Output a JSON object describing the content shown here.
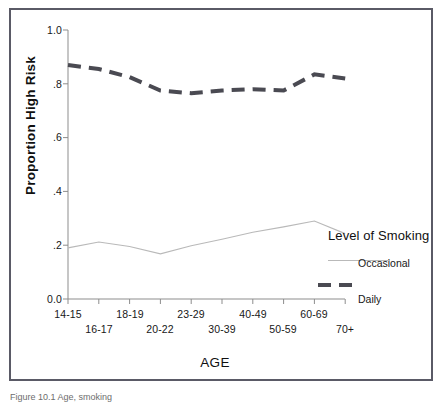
{
  "chart_data": {
    "type": "line",
    "title": "",
    "xlabel": "AGE",
    "ylabel": "Proportion High Risk",
    "ylim": [
      0.0,
      1.0
    ],
    "ytick_labels": [
      "1.0",
      ".8",
      ".6",
      ".4",
      ".2",
      "0.0"
    ],
    "ytick_values": [
      1.0,
      0.8,
      0.6,
      0.4,
      0.2,
      0.0
    ],
    "grid": false,
    "legend_position": "right",
    "categories": [
      "14-15",
      "16-17",
      "18-19",
      "20-22",
      "23-29",
      "30-39",
      "40-49",
      "50-59",
      "60-69",
      "70+"
    ],
    "series": [
      {
        "name": "Daily",
        "style": "thick-dashed",
        "color": "#4a4a52",
        "values": [
          0.87,
          0.855,
          0.825,
          0.775,
          0.765,
          0.775,
          0.78,
          0.775,
          0.835,
          0.82
        ]
      },
      {
        "name": "Occasional",
        "style": "thin-solid",
        "color": "#b9b9b9",
        "values": [
          0.19,
          0.212,
          0.195,
          0.168,
          0.198,
          0.222,
          0.248,
          0.268,
          0.29,
          0.243
        ]
      }
    ]
  },
  "legend": {
    "title": "Level of Smoking",
    "entries": [
      {
        "label": "Occasional",
        "swatch": "thin-line-swatch"
      },
      {
        "label": "Daily",
        "swatch": "thick-dashed-swatch"
      }
    ]
  },
  "caption": {
    "text": "Figure 10.1  Age, smoking"
  }
}
